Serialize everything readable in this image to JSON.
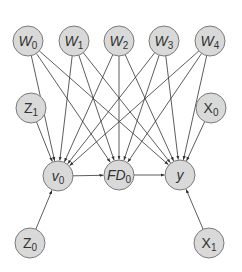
{
  "diagram": {
    "type": "directed-graph",
    "node_radius": 15,
    "colors": {
      "node_fill": "#d9d9d9",
      "node_stroke": "#7a7a7a",
      "edge": "#333333",
      "text": "#333333"
    },
    "nodes": [
      {
        "id": "W0",
        "base": "W",
        "sub": "0",
        "italic": true,
        "x": 28,
        "y": 41
      },
      {
        "id": "W1",
        "base": "W",
        "sub": "1",
        "italic": true,
        "x": 74,
        "y": 41
      },
      {
        "id": "W2",
        "base": "W",
        "sub": "2",
        "italic": true,
        "x": 119,
        "y": 41
      },
      {
        "id": "W3",
        "base": "W",
        "sub": "3",
        "italic": true,
        "x": 164,
        "y": 41
      },
      {
        "id": "W4",
        "base": "W",
        "sub": "4",
        "italic": true,
        "x": 210,
        "y": 41
      },
      {
        "id": "Z1",
        "base": "Z",
        "sub": "1",
        "italic": false,
        "x": 31,
        "y": 108
      },
      {
        "id": "X0",
        "base": "X",
        "sub": "0",
        "italic": false,
        "x": 211,
        "y": 108
      },
      {
        "id": "v0",
        "base": "v",
        "sub": "0",
        "italic": true,
        "x": 58,
        "y": 176
      },
      {
        "id": "FD0",
        "base": "FD",
        "sub": "0",
        "italic": true,
        "x": 119,
        "y": 175
      },
      {
        "id": "y",
        "base": "y",
        "sub": "",
        "italic": true,
        "x": 180,
        "y": 175
      },
      {
        "id": "Z0",
        "base": "Z",
        "sub": "0",
        "italic": false,
        "x": 30,
        "y": 243
      },
      {
        "id": "X1",
        "base": "X",
        "sub": "1",
        "italic": false,
        "x": 209,
        "y": 243
      }
    ],
    "edges": [
      [
        "W0",
        "v0"
      ],
      [
        "W0",
        "FD0"
      ],
      [
        "W0",
        "y"
      ],
      [
        "W1",
        "v0"
      ],
      [
        "W1",
        "FD0"
      ],
      [
        "W1",
        "y"
      ],
      [
        "W2",
        "v0"
      ],
      [
        "W2",
        "FD0"
      ],
      [
        "W2",
        "y"
      ],
      [
        "W3",
        "v0"
      ],
      [
        "W3",
        "FD0"
      ],
      [
        "W3",
        "y"
      ],
      [
        "W4",
        "v0"
      ],
      [
        "W4",
        "FD0"
      ],
      [
        "W4",
        "y"
      ],
      [
        "Z1",
        "v0"
      ],
      [
        "X0",
        "y"
      ],
      [
        "v0",
        "FD0"
      ],
      [
        "FD0",
        "y"
      ],
      [
        "Z0",
        "v0"
      ],
      [
        "X1",
        "y"
      ]
    ]
  }
}
